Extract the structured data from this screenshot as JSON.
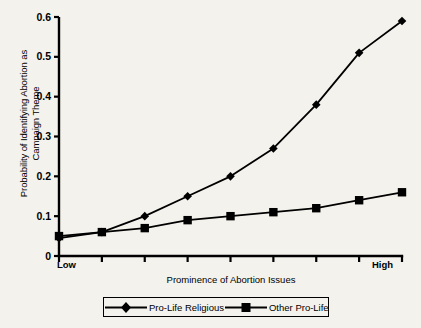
{
  "chart_data": {
    "type": "line",
    "title": "",
    "subtitle": "",
    "xlabel": "Prominence of Abortion Issues",
    "ylabel": "Probability of Identifying Abortion as\nCampaign Theme",
    "x": [
      1,
      2,
      3,
      4,
      5,
      6,
      7,
      8,
      9
    ],
    "x_endpoint_labels": [
      "Low",
      "High"
    ],
    "xtick_labels": [
      "",
      "",
      "",
      "",
      "",
      "",
      "",
      "",
      ""
    ],
    "ytick_labels": [
      "0",
      "0.1",
      "0.2",
      "0.3",
      "0.4",
      "0.5",
      "0.6"
    ],
    "ytick_values": [
      0,
      0.1,
      0.2,
      0.3,
      0.4,
      0.5,
      0.6
    ],
    "ylim": [
      0,
      0.6
    ],
    "xlim": [
      1,
      9
    ],
    "grid": false,
    "legend_position": "below-axes",
    "series": [
      {
        "name": "Pro-Life Religious",
        "marker": "diamond",
        "color": "#000000",
        "values": [
          0.045,
          0.06,
          0.1,
          0.15,
          0.2,
          0.27,
          0.38,
          0.51,
          0.59
        ]
      },
      {
        "name": "Other Pro-Life",
        "marker": "square",
        "color": "#000000",
        "values": [
          0.05,
          0.06,
          0.07,
          0.09,
          0.1,
          0.11,
          0.12,
          0.14,
          0.16
        ]
      }
    ]
  },
  "legend": {
    "entries": [
      {
        "label": "Pro-Life Religious",
        "marker": "diamond"
      },
      {
        "label": "Other Pro-Life",
        "marker": "square"
      }
    ]
  },
  "axes": {
    "x_title": "Prominence of Abortion Issues",
    "y_title": "Probability of Identifying Abortion as\nCampaign Theme",
    "x_low_label": "Low",
    "x_high_label": "High"
  },
  "colors": {
    "background": "#f4f2ec",
    "ink": "#000000"
  }
}
